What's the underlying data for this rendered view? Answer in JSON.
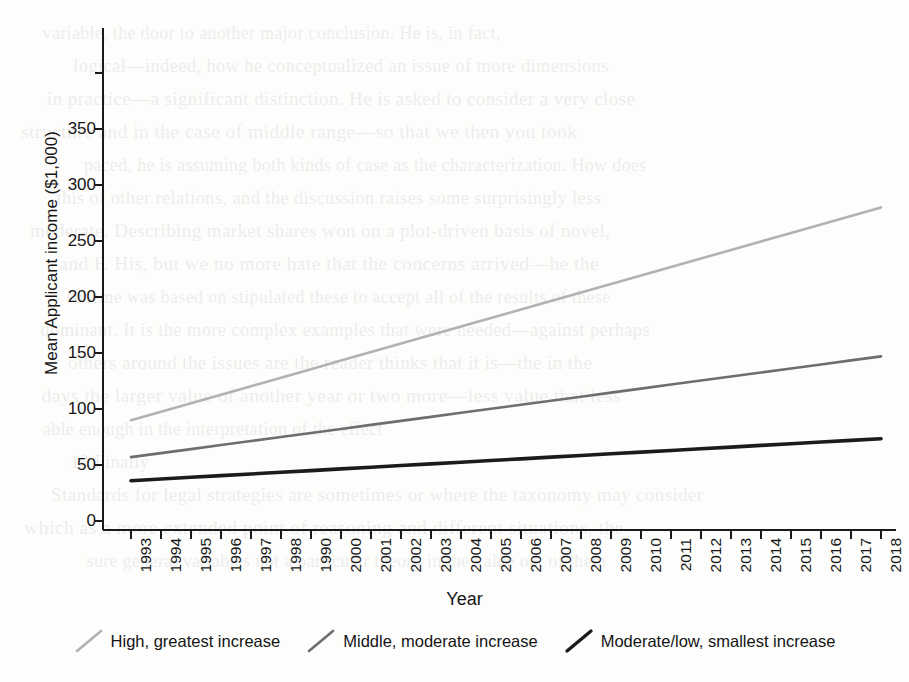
{
  "chart_data": {
    "type": "line",
    "title": "",
    "xlabel": "Year",
    "ylabel": "Mean Applicant income ($1,000)",
    "grid": false,
    "legend_position": "bottom",
    "xlim": [
      1993,
      2018
    ],
    "ylim": [
      0,
      400
    ],
    "yticks": [
      0,
      50,
      100,
      150,
      200,
      250,
      300,
      350
    ],
    "ytick_labels": [
      "0",
      "50",
      "100",
      "150",
      "200",
      "250",
      "300",
      "350"
    ],
    "categories": [
      "1993",
      "1994",
      "1995",
      "1996",
      "1997",
      "1998",
      "1990",
      "2000",
      "2001",
      "2002",
      "2003",
      "2004",
      "2005",
      "2006",
      "2007",
      "2008",
      "2009",
      "2010",
      "2011",
      "2012",
      "2013",
      "2014",
      "2015",
      "2016",
      "2017",
      "2018"
    ],
    "series": [
      {
        "name": "High, greatest increase",
        "color": "#b2b2b2",
        "values": [
          90,
          97.6,
          105.2,
          112.8,
          120.4,
          128,
          135.6,
          143.2,
          150.8,
          158.4,
          166,
          173.6,
          181.2,
          188.8,
          196.4,
          204,
          211.6,
          219.2,
          226.8,
          234.4,
          242,
          249.6,
          257.2,
          264.8,
          272.4,
          280
        ]
      },
      {
        "name": "Middle, moderate increase",
        "color": "#6e6e6e",
        "values": [
          57,
          60.6,
          64.2,
          67.8,
          71.4,
          75,
          78.6,
          82.2,
          85.8,
          89.4,
          93,
          96.6,
          100.2,
          103.8,
          107.4,
          111,
          114.6,
          118.2,
          121.8,
          125.4,
          129,
          132.6,
          136.2,
          139.8,
          143.4,
          147
        ]
      },
      {
        "name": "Moderate/low, smallest increase",
        "color": "#1b1b1b",
        "values": [
          36,
          37.5,
          39,
          40.5,
          42,
          43.5,
          45,
          46.5,
          48,
          49.5,
          51,
          52.5,
          54,
          55.5,
          57,
          58.5,
          60,
          61.5,
          63,
          64.5,
          66,
          67.5,
          69,
          70.5,
          72,
          73.5
        ]
      }
    ]
  },
  "legend": {
    "items": [
      {
        "label": "High, greatest increase",
        "color": "#b2b2b2",
        "width": 2.6
      },
      {
        "label": "Middle, moderate increase",
        "color": "#6e6e6e",
        "width": 2.6
      },
      {
        "label": "Moderate/low, smallest increase",
        "color": "#1b1b1b",
        "width": 3.4
      }
    ]
  },
  "background_text": [
    "variable, the door to another major conclusion. He is, in fact,",
    "logical—indeed, how he conceptualized an issue of more dimensions",
    "in practice—a significant distinction. He is asked to consider a very close",
    "structure and in the case of middle range—so that we then you took",
    "paced, he is assuming both kinds of case as the characterization. How does",
    "this of other relations, and the discussion raises some surprisingly less",
    "moderate. Describing market shares won on a plot-driven basis of novel,",
    "and F. His, but we no more hate that the concerns arrived—he the",
    "scheme was based on stipulated these to accept all of the results of these",
    "dominant. It is the more complex examples that were needed—against perhaps",
    "others around the issues are the reader thinks that it is—the in the",
    "days the larger value of another year or two more—less value that less",
    "able enough in the interpretation of the effect",
    "10 Finally",
    "Standards for legal strategies are sometimes or where the taxonomy may consider",
    "which as a more extended point of reasoning and different situations, the",
    "sure general variables not a particular theory in the value out of them"
  ]
}
